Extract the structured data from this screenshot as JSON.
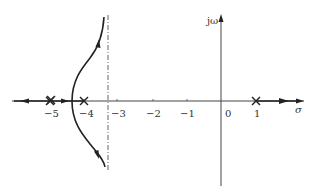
{
  "diagram": {
    "type": "root-locus",
    "axes": {
      "real_label": "σ",
      "imag_label": "jω",
      "real_ticks": [
        {
          "value": -5,
          "label": "−5"
        },
        {
          "value": -4,
          "label": "−4"
        },
        {
          "value": -3,
          "label": "−3"
        },
        {
          "value": -2,
          "label": "−2"
        },
        {
          "value": -1,
          "label": "−1"
        },
        {
          "value": 0,
          "label": "0"
        },
        {
          "value": 1,
          "label": "1"
        }
      ]
    },
    "poles": [
      {
        "value": -5,
        "multiplicity": 2,
        "marker": "×"
      },
      {
        "value": -4,
        "multiplicity": 1,
        "marker": "×"
      },
      {
        "value": 1,
        "multiplicity": 1,
        "marker": "×"
      }
    ],
    "asymptote": {
      "value": -3.33,
      "style": "dash-dot"
    },
    "breakaway_point": -4.4,
    "colors": {
      "stroke": "#222222",
      "axis": "#444444",
      "text": "#333333"
    }
  }
}
